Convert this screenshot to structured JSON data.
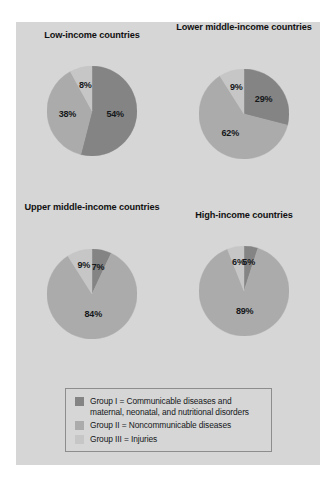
{
  "figure": {
    "background": "#ffffff",
    "panel_background": "#d6d6d6"
  },
  "colors": {
    "group1": "#848484",
    "group2": "#ababab",
    "group3": "#c6c6c6",
    "outline": "#8d8d8d",
    "text": "#15171a"
  },
  "chart_data": {
    "type": "pie",
    "title": "",
    "legend_position": "bottom",
    "series_names": [
      "Group I",
      "Group II",
      "Group III"
    ],
    "charts": [
      {
        "title": "Low-income countries",
        "categories": [
          "Group I",
          "Group II",
          "Group III"
        ],
        "values": [
          54,
          38,
          8
        ],
        "labels": [
          "54%",
          "38%",
          "8%"
        ]
      },
      {
        "title": "Lower middle-income countries",
        "categories": [
          "Group I",
          "Group II",
          "Group III"
        ],
        "values": [
          29,
          62,
          9
        ],
        "labels": [
          "29%",
          "62%",
          "9%"
        ]
      },
      {
        "title": "Upper middle-income countries",
        "categories": [
          "Group I",
          "Group II",
          "Group III"
        ],
        "values": [
          7,
          84,
          9
        ],
        "labels": [
          "7%",
          "84%",
          "9%"
        ]
      },
      {
        "title": "High-income countries",
        "categories": [
          "Group I",
          "Group II",
          "Group III"
        ],
        "values": [
          5,
          89,
          6
        ],
        "labels": [
          "5%",
          "89%",
          "6%"
        ]
      }
    ],
    "legend": [
      {
        "key": "group1",
        "line1": "Group I = Communicable diseases and",
        "line2": "maternal, neonatal, and nutritional disorders"
      },
      {
        "key": "group2",
        "line1": "Group II = Noncommunicable diseases",
        "line2": ""
      },
      {
        "key": "group3",
        "line1": "Group III = Injuries",
        "line2": ""
      }
    ]
  }
}
